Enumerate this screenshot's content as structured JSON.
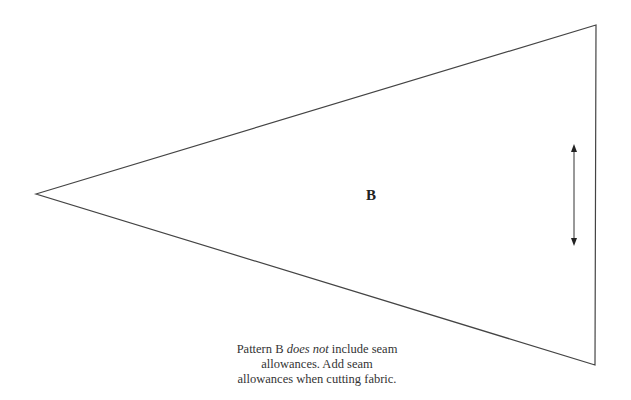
{
  "pattern": {
    "label": "B",
    "shape": "triangle",
    "vertices": [
      [
        36,
        194
      ],
      [
        596,
        25
      ],
      [
        595,
        365
      ]
    ],
    "stroke_color": "#444444",
    "grainline_arrow": {
      "x": 574,
      "y1": 145,
      "y2": 245,
      "direction": "double-headed vertical"
    }
  },
  "note": {
    "part1": "Pattern B ",
    "emphasis": "does not",
    "part2": " include seam allowances. Add seam allowances when cutting fabric."
  }
}
